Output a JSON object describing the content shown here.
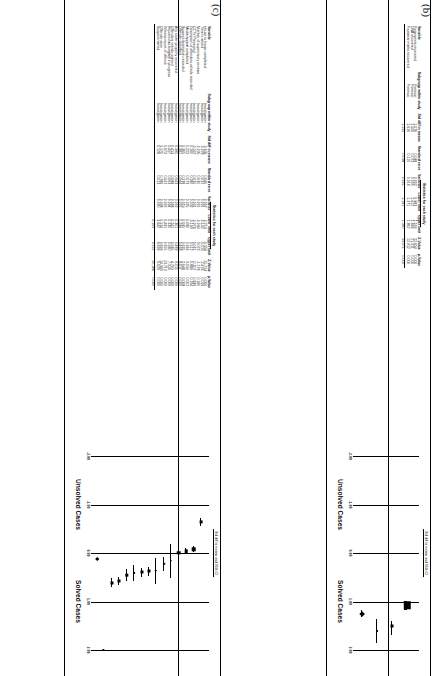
{
  "figure": {
    "panels": [
      {
        "letter": "(b)",
        "table": {
          "group_header": "Statistics for each study",
          "headers": {
            "variable": "Variable",
            "subgroup": "Subgroup within study",
            "std_diff": "Std diff in means",
            "std_err": "Standard error",
            "variance": "Variance",
            "lower": "Lower limit",
            "upper": "Upper limit",
            "z": "Z-Value",
            "p": "p-Value"
          },
          "rows": [
            {
              "variable": "Fingerprints recovered",
              "subgroup": "Forensic",
              "std_diff": "1.076",
              "std_err": "0.048",
              "variance": "0.002",
              "lower": "0.983",
              "upper": "1.169",
              "z": "22.654",
              "p": "0.000"
            },
            {
              "variable": "DNA recovered",
              "subgroup": "Forensic",
              "std_diff": "1.506",
              "std_err": "0.073",
              "variance": "0.005",
              "lower": "1.412",
              "upper": "1.699",
              "z": "21.311",
              "p": "0.000"
            },
            {
              "variable": "Footwear marks recovered",
              "subgroup": "Forensic",
              "std_diff": "1.616",
              "std_err": "0.125",
              "variance": "0.016",
              "lower": "1.371",
              "upper": "1.862",
              "z": "12.912",
              "p": "0.000"
            },
            {
              "variable": "",
              "subgroup": "",
              "std_diff": "1.255",
              "std_err": "0.038",
              "variance": "0.001",
              "lower": "1.181",
              "upper": "1.330",
              "z": "33.071",
              "p": "0.000"
            }
          ]
        },
        "plot": {
          "title": "Std diff in means and 95% CI",
          "ticks": [
            "-2.00",
            "-1.00",
            "0.00",
            "1.00",
            "2.00"
          ],
          "left_label": "Unsolved Cases",
          "right_label": "Solved Cases",
          "points": [
            {
              "mean": 1.076,
              "lower": 0.983,
              "upper": 1.169,
              "size": 7.5,
              "shape": "square"
            },
            {
              "mean": 1.506,
              "lower": 1.412,
              "upper": 1.699,
              "size": 3.0,
              "shape": "square"
            },
            {
              "mean": 1.616,
              "lower": 1.371,
              "upper": 1.862,
              "size": 2.0,
              "shape": "square"
            },
            {
              "mean": 1.255,
              "lower": 1.181,
              "upper": 1.33,
              "size": 4.2,
              "shape": "diamond"
            }
          ]
        }
      },
      {
        "letter": "(c)",
        "table": {
          "group_header": "Statistics for each study",
          "headers": {
            "variable": "Variable",
            "subgroup": "Subgroup within study",
            "std_diff": "Std diff in means",
            "std_err": "Standard error",
            "variance": "Variance",
            "lower": "Lower limit",
            "upper": "Upper limit",
            "z": "Z-Value",
            "p": "p-Value"
          },
          "rows": [
            {
              "variable": "House to house completed",
              "subgroup": "Investigation",
              "std_diff": "-0.635",
              "std_err": "0.040",
              "variance": "0.002",
              "lower": "-0.714",
              "upper": "-0.556",
              "z": "-15.714",
              "p": "0.000"
            },
            {
              "variable": "Time to attend",
              "subgroup": "Investigation",
              "std_diff": "-0.078",
              "std_err": "0.032",
              "variance": "0.001",
              "lower": "-0.142",
              "upper": "-0.015",
              "z": "-2.418",
              "p": "0.016"
            },
            {
              "variable": "Number of supervisory reviews",
              "subgroup": "Investigation",
              "std_diff": "-0.035",
              "std_err": "0.030",
              "variance": "0.001",
              "lower": "-0.094",
              "upper": "0.023",
              "z": "-1.178",
              "p": "0.240"
            },
            {
              "variable": "CCTV Preserved",
              "subgroup": "Investigation",
              "std_diff": "-0.007",
              "std_err": "0.035",
              "variance": "0.001",
              "lower": "-0.076",
              "upper": "0.061",
              "z": "-0.207",
              "p": "0.836"
            },
            {
              "variable": "Description of offenders vehicle recorded",
              "subgroup": "Investigation",
              "std_diff": "0.160",
              "std_err": "0.180",
              "variance": "0.032",
              "lower": "-0.193",
              "upper": "0.512",
              "z": "0.889",
              "p": "0.374"
            },
            {
              "variable": "Media appeal completed",
              "subgroup": "Investigation",
              "std_diff": "0.223",
              "std_err": "0.073",
              "variance": "0.005",
              "lower": "0.080",
              "upper": "0.366",
              "z": "3.054",
              "p": "0.002"
            },
            {
              "variable": "Suspect description recorded",
              "subgroup": "Investigation",
              "std_diff": "0.365",
              "std_err": "0.138",
              "variance": "0.019",
              "lower": "0.095",
              "upper": "0.635",
              "z": "2.648",
              "p": "0.008"
            },
            {
              "variable": "Offender disturbed",
              "subgroup": "Investigation",
              "std_diff": "0.381",
              "std_err": "0.044",
              "variance": "0.002",
              "lower": "0.294",
              "upper": "0.468",
              "z": "8.617",
              "p": "0.000"
            },
            {
              "variable": "Any stolen property recovered",
              "subgroup": "Investigation",
              "std_diff": "0.395",
              "std_err": "0.043",
              "variance": "0.002",
              "lower": "0.301",
              "upper": "0.489",
              "z": "9.015",
              "p": "0.000"
            },
            {
              "variable": "Offenders vehicle sighted",
              "subgroup": "Investigation",
              "std_diff": "0.413",
              "std_err": "0.088",
              "variance": "0.008",
              "lower": "0.241",
              "upper": "0.585",
              "z": "4.703",
              "p": "0.000"
            },
            {
              "variable": "Reported as burglary in progress",
              "subgroup": "Investigation",
              "std_diff": "0.457",
              "std_err": "0.063",
              "variance": "0.004",
              "lower": "0.335",
              "upper": "0.580",
              "z": "7.314",
              "p": "0.000"
            },
            {
              "variable": "Witness report of offence",
              "subgroup": "Investigation",
              "std_diff": "0.673",
              "std_err": "0.042",
              "variance": "0.002",
              "lower": "0.491",
              "upper": "0.655",
              "z": "13.713",
              "p": "0.000"
            },
            {
              "variable": "Offender seen",
              "subgroup": "Investigation",
              "std_diff": "5.170",
              "std_err": "0.786",
              "variance": "0.008",
              "lower": "0.524",
              "upper": "0.699",
              "z": "14.393",
              "p": "0.000"
            },
            {
              "variable": "Suspect named",
              "subgroup": "Investigation",
              "std_diff": "0.128",
              "std_err": "0.013",
              "variance": "0.000",
              "lower": "3.642",
              "upper": "6.699",
              "z": "6.629",
              "p": "0.000"
            },
            {
              "variable": "",
              "subgroup": "",
              "std_diff": "",
              "std_err": "",
              "variance": "",
              "lower": "0.103",
              "upper": "0.152",
              "z": "10.188",
              "p": "0.000"
            }
          ]
        },
        "plot": {
          "title": "Std diff in means and 95% CI",
          "ticks": [
            "-2.00",
            "-1.00",
            "0.00",
            "1.00",
            "2.00"
          ],
          "left_label": "Unsolved Cases",
          "right_label": "Solved Cases",
          "points": [
            {
              "mean": -0.635,
              "lower": -0.714,
              "upper": -0.556,
              "size": 3.2,
              "shape": "square"
            },
            {
              "mean": -0.078,
              "lower": -0.142,
              "upper": -0.015,
              "size": 3.4,
              "shape": "square"
            },
            {
              "mean": -0.035,
              "lower": -0.094,
              "upper": 0.023,
              "size": 3.4,
              "shape": "square"
            },
            {
              "mean": -0.007,
              "lower": -0.076,
              "upper": 0.061,
              "size": 3.4,
              "shape": "square"
            },
            {
              "mean": 0.16,
              "lower": -0.193,
              "upper": 0.512,
              "size": 1.6,
              "shape": "square"
            },
            {
              "mean": 0.223,
              "lower": 0.08,
              "upper": 0.366,
              "size": 2.4,
              "shape": "square"
            },
            {
              "mean": 0.365,
              "lower": 0.095,
              "upper": 0.635,
              "size": 1.8,
              "shape": "square"
            },
            {
              "mean": 0.381,
              "lower": 0.294,
              "upper": 0.468,
              "size": 3.0,
              "shape": "square"
            },
            {
              "mean": 0.395,
              "lower": 0.301,
              "upper": 0.489,
              "size": 3.0,
              "shape": "square"
            },
            {
              "mean": 0.413,
              "lower": 0.241,
              "upper": 0.585,
              "size": 2.2,
              "shape": "square"
            },
            {
              "mean": 0.457,
              "lower": 0.335,
              "upper": 0.58,
              "size": 2.6,
              "shape": "square"
            },
            {
              "mean": 0.573,
              "lower": 0.491,
              "upper": 0.655,
              "size": 3.0,
              "shape": "square"
            },
            {
              "mean": 0.611,
              "lower": 0.524,
              "upper": 0.699,
              "size": 3.0,
              "shape": "square"
            },
            {
              "mean": 5.17,
              "lower": 3.642,
              "upper": 6.699,
              "size": 2.0,
              "shape": "arrow"
            },
            {
              "mean": 0.128,
              "lower": 0.103,
              "upper": 0.152,
              "size": 3.4,
              "shape": "diamond"
            }
          ]
        }
      }
    ]
  }
}
